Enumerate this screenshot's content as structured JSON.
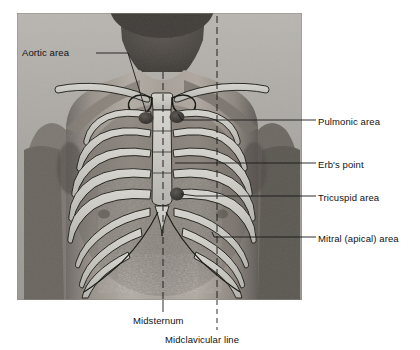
{
  "figure": {
    "photo": {
      "name": "male-torso-photograph",
      "x": 17,
      "y": 13,
      "width": 285,
      "height": 287,
      "description": "grayscale photograph of adult male anterior thorax, head cropped at top"
    }
  },
  "labels": {
    "aortic": "Aortic area",
    "pulmonic": "Pulmonic area",
    "erb": "Erb's point",
    "tricuspid": "Tricuspid area",
    "mitral": "Mitral (apical) area",
    "midsternum": "Midsternum",
    "midclavicular": "Midclavicular line"
  },
  "auscultation_points": [
    {
      "id": "aortic",
      "label": "Aortic area",
      "x": 146,
      "y": 118,
      "rx": 7.5,
      "ry": 6.0
    },
    {
      "id": "pulmonic",
      "label": "Pulmonic area",
      "x": 177,
      "y": 117,
      "rx": 7.5,
      "ry": 6.0
    },
    {
      "id": "tricuspid",
      "label": "Tricuspid area",
      "x": 177,
      "y": 194,
      "rx": 7.0,
      "ry": 6.5
    },
    {
      "id": "mitral",
      "label": "Mitral (apical) area",
      "x": 212,
      "y": 232,
      "rx": 0,
      "ry": 0
    }
  ],
  "reference_lines": [
    {
      "id": "midsternum",
      "label": "Midsternum",
      "x": 163,
      "style": "dashed",
      "y_top": 72,
      "y_bottom": 300
    },
    {
      "id": "midclavicular",
      "label": "Midclavicular line",
      "x": 217,
      "style": "dashed",
      "y_top": 16,
      "y_bottom": 300
    }
  ],
  "colors": {
    "bone": "#c9c9c4",
    "bone_edge": "#1a1a1a",
    "marker": "#3a3a3a",
    "leader": "#1a1a1a",
    "text": "#111111",
    "background": "#ffffff"
  }
}
